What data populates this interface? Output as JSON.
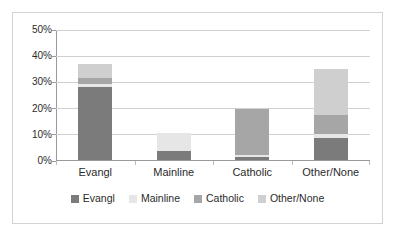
{
  "chart_data": {
    "type": "bar",
    "subtype": "stacked-bar",
    "title": "",
    "xlabel": "",
    "ylabel": "",
    "categories": [
      "Evangl",
      "Mainline",
      "Catholic",
      "Other/None"
    ],
    "series": [
      {
        "name": "Evangl",
        "color": "#7b7b7b",
        "values": [
          27.7,
          3.5,
          1.2,
          8.5
        ]
      },
      {
        "name": "Mainline",
        "color": "#e6e6e6",
        "values": [
          1.5,
          6.9,
          0.6,
          1.5
        ]
      },
      {
        "name": "Catholic",
        "color": "#a6a6a6",
        "values": [
          2.3,
          0.0,
          17.8,
          7.3
        ]
      },
      {
        "name": "Other/None",
        "color": "#cfcfcf",
        "values": [
          5.0,
          0.0,
          0.0,
          17.3
        ]
      }
    ],
    "ylim": [
      0,
      50
    ],
    "yticks": [
      0,
      10,
      20,
      30,
      40,
      50
    ],
    "ytick_labels": [
      "0%",
      "10%",
      "20%",
      "30%",
      "40%",
      "50%"
    ],
    "grid": true,
    "grid_axis": "y",
    "legend_position": "bottom",
    "totals": [
      36.5,
      10.4,
      19.6,
      34.6
    ]
  },
  "legend": {
    "items": [
      {
        "label": "Evangl",
        "color": "#7b7b7b"
      },
      {
        "label": "Mainline",
        "color": "#e6e6e6"
      },
      {
        "label": "Catholic",
        "color": "#a6a6a6"
      },
      {
        "label": "Other/None",
        "color": "#cfcfcf"
      }
    ]
  },
  "axes": {
    "y_tick_labels": [
      "50%",
      "40%",
      "30%",
      "20%",
      "10%",
      "0%"
    ],
    "x_tick_labels": [
      "Evangl",
      "Mainline",
      "Catholic",
      "Other/None"
    ]
  },
  "caption": {
    "clipped_top_text": ""
  },
  "colors": {
    "plot_background": "#ffffff",
    "grid": "#d0d0d0",
    "axis": "#9a9a9a",
    "border": "#d3d3d3",
    "text": "#2b2b2b"
  }
}
